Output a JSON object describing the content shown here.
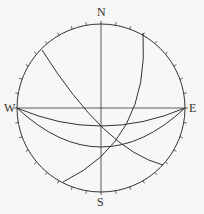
{
  "diagram": {
    "type": "stereonet",
    "center": [
      101,
      108
    ],
    "radius": 84,
    "labels": {
      "north": "N",
      "south": "S",
      "west": "W",
      "east": "E"
    },
    "tick_interval_deg": 10,
    "line_color": "#333333",
    "great_circles": [
      {
        "name": "arc-nw-se",
        "path": "M42,50 Q105,150 163,165"
      },
      {
        "name": "arc-ne-sw",
        "path": "M143,33 Q150,140 63,182"
      },
      {
        "name": "arc-we-shallow",
        "path": "M17,108 Q101,144 185,108"
      },
      {
        "name": "arc-we-deep",
        "path": "M17,108 Q101,186 185,108"
      }
    ]
  }
}
